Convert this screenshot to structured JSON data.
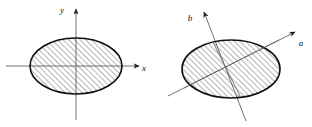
{
  "figure": {
    "title": "",
    "background_color": "#ffffff",
    "stroke_color": "#1a1a1a",
    "hatch_color": "#555555",
    "axis_color": "#6b6b6b",
    "panels": [
      {
        "name": "left-panel",
        "description": "hatched ellipse centered on orthogonal x-y axes",
        "ellipse": {
          "cx": 76,
          "cy": 66,
          "rx": 46,
          "ry": 28,
          "rotation_deg": 0,
          "fill": "hatched"
        },
        "axes": [
          {
            "name": "x-axis",
            "label": "x",
            "label_x": 144,
            "label_y": 71,
            "x1": 6,
            "y1": 66,
            "x2": 139,
            "y2": 66,
            "arrow": "end"
          },
          {
            "name": "y-axis",
            "label": "y",
            "label_x": 62,
            "label_y": 13,
            "x1": 76,
            "y1": 120,
            "x2": 76,
            "y2": 9,
            "arrow": "end"
          }
        ]
      },
      {
        "name": "right-panel",
        "description": "hatched ellipse with rotated principal axes a and b",
        "ellipse": {
          "cx": 231,
          "cy": 69,
          "rx": 49,
          "ry": 29,
          "rotation_deg": 0,
          "fill": "hatched"
        },
        "axes": [
          {
            "name": "a-axis",
            "label": "a",
            "label_x": 301,
            "label_y": 46,
            "x1": 168,
            "y1": 96,
            "x2": 295,
            "y2": 32,
            "arrow": "end"
          },
          {
            "name": "b-axis",
            "label": "b",
            "label_x": 190,
            "label_y": 21,
            "x1": 246,
            "y1": 121,
            "x2": 204,
            "y2": 12,
            "arrow": "end"
          }
        ]
      }
    ]
  }
}
